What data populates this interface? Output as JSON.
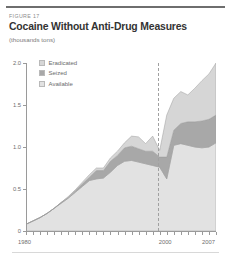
{
  "figure": {
    "number_label": "FIGURE 17",
    "title": "Cocaine Without Anti-Drug Measures",
    "subtitle": "(thousands tons)"
  },
  "legend": {
    "position": "top-left-inside",
    "items": [
      {
        "label": "Eradicated",
        "color": "#d6d6d6"
      },
      {
        "label": "Seized",
        "color": "#a8a8a8"
      },
      {
        "label": "Available",
        "color": "#e2e2e2"
      }
    ]
  },
  "annotations": [
    {
      "name": "projection-divider",
      "type": "vertical-dashed-line",
      "x_value": 2000,
      "color": "#a0a0a0"
    }
  ],
  "chart_data": {
    "type": "area",
    "stacked": true,
    "title": "Cocaine Without Anti-Drug Measures",
    "subtitle": "(thousands tons)",
    "xlabel": "",
    "ylabel": "",
    "grid": false,
    "xlim": [
      1980,
      2007
    ],
    "ylim": [
      0,
      2.0
    ],
    "yticks": [
      0,
      0.5,
      1.0,
      1.5,
      2.0
    ],
    "ytick_labels": [
      "0",
      "0.5",
      "1.0",
      "1.5",
      "2.0"
    ],
    "xticks": [
      1980,
      1981,
      1982,
      1983,
      1984,
      1985,
      1986,
      1987,
      1988,
      1989,
      1990,
      1991,
      1992,
      1993,
      1994,
      1995,
      1996,
      1997,
      1998,
      1999,
      2000,
      2001,
      2002,
      2003,
      2004,
      2005,
      2006,
      2007
    ],
    "xtick_labels_shown": [
      "1980",
      "2000",
      "2007"
    ],
    "x": [
      1980,
      1981,
      1982,
      1983,
      1984,
      1985,
      1986,
      1987,
      1988,
      1989,
      1990,
      1991,
      1992,
      1993,
      1994,
      1995,
      1996,
      1997,
      1998,
      1999,
      2000,
      2001,
      2002,
      2003,
      2004,
      2005,
      2006,
      2007
    ],
    "series": [
      {
        "name": "Available",
        "color": "#e2e2e2",
        "values": [
          0.08,
          0.12,
          0.16,
          0.21,
          0.27,
          0.33,
          0.39,
          0.46,
          0.53,
          0.6,
          0.62,
          0.63,
          0.7,
          0.78,
          0.83,
          0.84,
          0.82,
          0.8,
          0.78,
          0.76,
          0.62,
          1.02,
          1.04,
          1.02,
          1.0,
          0.99,
          1.0,
          1.05
        ]
      },
      {
        "name": "Seized",
        "color": "#a8a8a8",
        "values": [
          0.0,
          0.0,
          0.0,
          0.0,
          0.0,
          0.01,
          0.01,
          0.02,
          0.03,
          0.04,
          0.1,
          0.09,
          0.13,
          0.12,
          0.16,
          0.17,
          0.16,
          0.15,
          0.17,
          0.12,
          0.26,
          0.18,
          0.24,
          0.28,
          0.3,
          0.32,
          0.33,
          0.33
        ]
      },
      {
        "name": "Eradicated",
        "color": "#d6d6d6",
        "values": [
          0.0,
          0.0,
          0.0,
          0.0,
          0.0,
          0.0,
          0.01,
          0.01,
          0.02,
          0.03,
          0.03,
          0.03,
          0.04,
          0.05,
          0.06,
          0.12,
          0.14,
          0.09,
          0.18,
          0.08,
          0.5,
          0.38,
          0.38,
          0.32,
          0.4,
          0.48,
          0.54,
          0.62
        ]
      }
    ],
    "totals": [
      0.08,
      0.12,
      0.16,
      0.21,
      0.27,
      0.34,
      0.41,
      0.49,
      0.58,
      0.67,
      0.75,
      0.75,
      0.87,
      0.95,
      1.05,
      1.13,
      1.12,
      1.04,
      1.13,
      0.96,
      1.38,
      1.58,
      1.66,
      1.62,
      1.7,
      1.79,
      1.87,
      2.0
    ]
  }
}
